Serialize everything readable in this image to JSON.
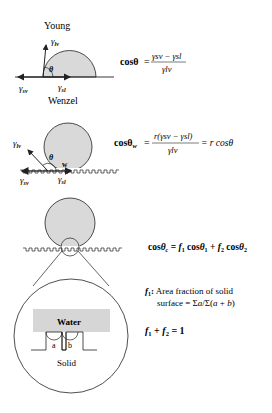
{
  "figure": {
    "young": {
      "title": "Young",
      "gamma_lv": "γ",
      "gamma_lv_sub": "lv",
      "gamma_sv": "γ",
      "gamma_sv_sub": "sv",
      "gamma_sl": "γ",
      "gamma_sl_sub": "sl",
      "theta": "θ",
      "equation": {
        "lhs": "cosθ",
        "eq": "=",
        "numerator": "γsv − γsl",
        "denominator": "γlv"
      }
    },
    "wenzel": {
      "title": "Wenzel",
      "gamma_lv": "γ",
      "gamma_lv_sub": "lv",
      "gamma_sv": "γ",
      "gamma_sv_sub": "sv",
      "gamma_sl": "γ",
      "gamma_sl_sub": "sl",
      "theta": "θ",
      "w_label": "w",
      "equation": {
        "lhs": "cosθ",
        "lhs_sub": "w",
        "eq": "=",
        "numerator": "r(γsv − γsl)",
        "denominator": "γlv",
        "rhs": "= r cosθ"
      }
    },
    "cassie": {
      "equation": "cosθc = f1 cosθ1 + f2 cosθ2",
      "f1_label": "f1:",
      "f1_desc_line1": "Area fraction of solid",
      "f1_desc_line2": "surface = Σa/Σ(a + b)",
      "sum_eq": "f1 + f2 = 1",
      "inset": {
        "water_label": "Water",
        "solid_label": "Solid",
        "a_label": "a",
        "b_label": "b"
      }
    },
    "colors": {
      "droplet_fill": "#d9d9d9",
      "water_fill": "#d6d6d6",
      "line": "#222222"
    }
  },
  "caption": "(figure caption truncated)"
}
